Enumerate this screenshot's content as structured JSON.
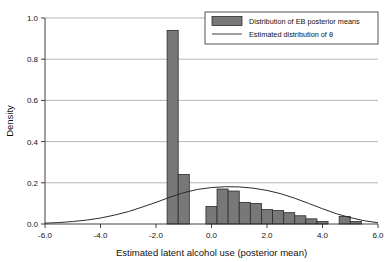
{
  "chart_data": {
    "type": "bar",
    "title": "",
    "xlabel": "Estimated latent alcohol use (posterior mean)",
    "ylabel": "Density",
    "xlim": [
      -6.0,
      6.0
    ],
    "ylim": [
      0.0,
      1.0
    ],
    "xticks": [
      -6.0,
      -4.0,
      -2.0,
      0.0,
      2.0,
      4.0,
      6.0
    ],
    "xticklabels": [
      "-6.0",
      "-4.0",
      "-2.0",
      "0.0",
      "2.0",
      "4.0",
      "6.0"
    ],
    "yticks": [
      0.0,
      0.2,
      0.4,
      0.6,
      0.8,
      1.0
    ],
    "yticklabels": [
      "0.0",
      "0.2",
      "0.4",
      "0.6",
      "0.8",
      "1.0"
    ],
    "grid": "horizontal",
    "legend_position": "top-right",
    "bar_width": 0.4,
    "bar_fill": "#787878",
    "bar_edge": "#2b2b2b",
    "curve_color": "#2b2b2b",
    "series": [
      {
        "name": "Distribution of EB posterior means",
        "type": "bar",
        "bins_left": [
          -1.6,
          -1.2,
          -0.2,
          0.2,
          0.6,
          1.0,
          1.4,
          1.8,
          2.2,
          2.6,
          3.0,
          3.4,
          3.8,
          4.6,
          5.0
        ],
        "values": [
          0.94,
          0.24,
          0.085,
          0.17,
          0.16,
          0.105,
          0.1,
          0.07,
          0.065,
          0.055,
          0.04,
          0.025,
          0.012,
          0.037,
          0.012
        ]
      },
      {
        "name": "Estimated distribution of θ",
        "type": "line",
        "x": [
          -6.0,
          -5.5,
          -5.0,
          -4.5,
          -4.0,
          -3.5,
          -3.0,
          -2.5,
          -2.0,
          -1.5,
          -1.0,
          -0.5,
          0.0,
          0.5,
          1.0,
          1.5,
          2.0,
          2.5,
          3.0,
          3.5,
          4.0,
          4.5,
          5.0,
          5.5,
          6.0
        ],
        "y": [
          0.004,
          0.007,
          0.012,
          0.019,
          0.029,
          0.043,
          0.06,
          0.082,
          0.105,
          0.13,
          0.152,
          0.168,
          0.177,
          0.181,
          0.18,
          0.174,
          0.163,
          0.147,
          0.125,
          0.1,
          0.074,
          0.05,
          0.031,
          0.016,
          0.006
        ]
      }
    ]
  },
  "legend": {
    "items": [
      {
        "label": "Distribution of EB posterior means",
        "marker": "swatch"
      },
      {
        "label": "Estimated distribution of θ",
        "marker": "line"
      }
    ]
  }
}
